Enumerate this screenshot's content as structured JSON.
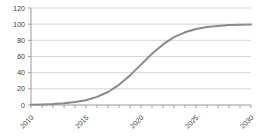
{
  "chart_data": {
    "type": "line",
    "title": "",
    "xlabel": "",
    "ylabel": "",
    "x": [
      2010,
      2011,
      2012,
      2013,
      2014,
      2015,
      2016,
      2017,
      2018,
      2019,
      2020,
      2021,
      2022,
      2023,
      2024,
      2025,
      2026,
      2027,
      2028,
      2029,
      2030
    ],
    "series": [
      {
        "name": "sigmoid-series",
        "values": [
          0.4,
          0.7,
          1.2,
          2.1,
          3.6,
          6.0,
          10.0,
          16.1,
          25.0,
          36.6,
          50.0,
          63.4,
          75.0,
          83.9,
          90.0,
          94.0,
          96.4,
          97.9,
          98.8,
          99.3,
          99.6
        ]
      }
    ],
    "xlim": [
      2010,
      2030
    ],
    "ylim": [
      0,
      120
    ],
    "yticks": [
      0,
      20,
      40,
      60,
      80,
      100,
      120
    ],
    "xticks_minor_every": 1,
    "xticks_labeled": [
      2010,
      2015,
      2020,
      2025,
      2030
    ],
    "x_label_rotation_deg": -45,
    "grid": "horizontal",
    "legend_position": "none",
    "colors": {
      "line": "#8a8a8a",
      "grid": "#d6d6d6",
      "axis": "#9b9b9b",
      "tick": "#9b9b9b",
      "label_text": "#3c3c3c",
      "background": "#ffffff"
    },
    "font": {
      "tick_label_size_px": 7
    }
  }
}
